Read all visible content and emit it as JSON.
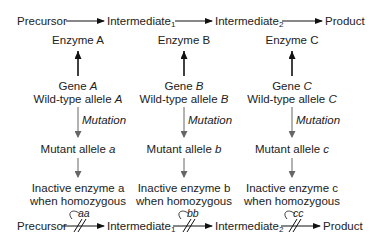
{
  "pathway": {
    "precursor": "Precursor",
    "intermediate1": "Intermediate",
    "intermediate2": "Intermediate",
    "product": "Product",
    "sub1": "1",
    "sub2": "2"
  },
  "columns": [
    {
      "enzyme": "Enzyme A",
      "gene_prefix": "Gene ",
      "gene_letter": "A",
      "wildtype_prefix": "Wild-type allele ",
      "wildtype_letter": "A",
      "mutation": "Mutation",
      "mutant_prefix": "Mutant allele ",
      "mutant_letter": "a",
      "inactive_line1": "Inactive enzyme a",
      "inactive_line2": "when homozygous",
      "genotype": "aa"
    },
    {
      "enzyme": "Enzyme B",
      "gene_prefix": "Gene ",
      "gene_letter": "B",
      "wildtype_prefix": "Wild-type allele ",
      "wildtype_letter": "B",
      "mutation": "Mutation",
      "mutant_prefix": "Mutant allele ",
      "mutant_letter": "b",
      "inactive_line1": "Inactive enzyme b",
      "inactive_line2": "when homozygous",
      "genotype": "bb"
    },
    {
      "enzyme": "Enzyme C",
      "gene_prefix": "Gene ",
      "gene_letter": "C",
      "wildtype_prefix": "Wild-type allele ",
      "wildtype_letter": "C",
      "mutation": "Mutation",
      "mutant_prefix": "Mutant allele ",
      "mutant_letter": "c",
      "inactive_line1": "Inactive enzyme c",
      "inactive_line2": "when homozygous",
      "genotype": "cc"
    }
  ],
  "colors": {
    "text": "#222222",
    "arrow_dark": "#111111",
    "arrow_gray": "#666666"
  }
}
